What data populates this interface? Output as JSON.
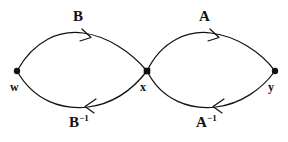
{
  "figure": {
    "type": "graph-diagram",
    "background_color": "#ffffff",
    "stroke_color": "#111111",
    "width": 288,
    "height": 142
  },
  "vertices": [
    {
      "id": "w",
      "label": "w",
      "cx": 17,
      "cy": 71,
      "shape": "dot",
      "radius": 3.2
    },
    {
      "id": "x",
      "label": "x",
      "cx": 147,
      "cy": 71,
      "shape": "dot",
      "radius": 3.4
    },
    {
      "id": "y",
      "label": "y",
      "cx": 275,
      "cy": 71,
      "shape": "dot",
      "radius": 3.2
    }
  ],
  "edges": [
    {
      "id": "edge-B",
      "label": "B",
      "label_base": "B",
      "label_sup": "",
      "from": "w",
      "to": "x",
      "side": "top",
      "direction": "right",
      "arrow_at": {
        "x": 88,
        "y": 36
      }
    },
    {
      "id": "edge-B-inverse",
      "label": "B⁻¹",
      "label_base": "B",
      "label_sup": "−1",
      "from": "x",
      "to": "w",
      "side": "bottom",
      "direction": "left",
      "arrow_at": {
        "x": 91,
        "y": 105
      }
    },
    {
      "id": "edge-A",
      "label": "A",
      "label_base": "A",
      "label_sup": "",
      "from": "x",
      "to": "y",
      "side": "top",
      "direction": "right",
      "arrow_at": {
        "x": 214,
        "y": 36
      }
    },
    {
      "id": "edge-A-inverse",
      "label": "A⁻¹",
      "label_base": "A",
      "label_sup": "−1",
      "from": "y",
      "to": "x",
      "side": "bottom",
      "direction": "left",
      "arrow_at": {
        "x": 219,
        "y": 105
      }
    }
  ],
  "labels": {
    "B": "B",
    "A": "A",
    "B_base": "B",
    "A_base": "A",
    "inverse_sup": "−1",
    "w": "w",
    "x": "x",
    "y": "y"
  }
}
